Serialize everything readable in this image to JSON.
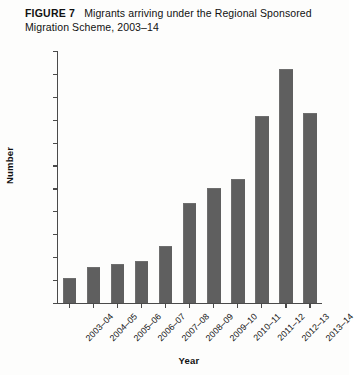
{
  "caption": {
    "label": "FIGURE 7",
    "title": "Migrants arriving under the Regional Sponsored Migration Scheme, 2003–14"
  },
  "chart_data": {
    "type": "bar",
    "title": "Migrants arriving under the Regional Sponsored Migration Scheme, 2003–14",
    "xlabel": "Year",
    "ylabel": "Number",
    "categories": [
      "2003–04",
      "2004–05",
      "2005–06",
      "2006–07",
      "2007–08",
      "2008–09",
      "2009–10",
      "2010–11",
      "2011–12",
      "2012–13",
      "2013–14"
    ],
    "values": [
      2200,
      3200,
      3450,
      3700,
      5000,
      8800,
      10100,
      10900,
      16400,
      20500,
      16600
    ],
    "ylim": [
      0,
      22000
    ],
    "ytick_step": 2000,
    "yticks": [
      0,
      2000,
      4000,
      6000,
      8000,
      10000,
      12000,
      14000,
      16000,
      18000,
      20000,
      22000
    ],
    "ytick_labels": [
      "0",
      "2000",
      "4000",
      "6000",
      "8000",
      "10 000",
      "12 000",
      "14 000",
      "16 000",
      "18 000",
      "20 000",
      "22 000"
    ],
    "grid": false,
    "legend": null,
    "bar_color": "#5f5f5f",
    "axis_color": "#4a4a4a",
    "background": "#fdfdfc"
  }
}
